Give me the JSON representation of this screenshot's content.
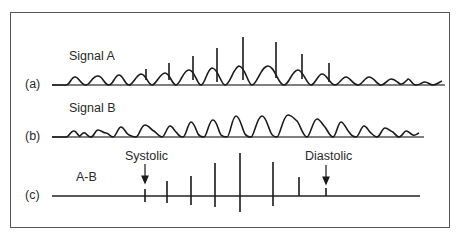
{
  "figure": {
    "rows": [
      {
        "id": "a",
        "marker": "(a)",
        "title": "Signal A"
      },
      {
        "id": "b",
        "marker": "(b)",
        "title": "Signal B"
      },
      {
        "id": "c",
        "marker": "(c)",
        "title": "A-B"
      }
    ],
    "annotations": {
      "systolic": "Systolic",
      "diastolic": "Diastolic"
    },
    "colors": {
      "trace": "#1a1a1a",
      "baseline": "#555555",
      "frame": "#555555"
    }
  }
}
